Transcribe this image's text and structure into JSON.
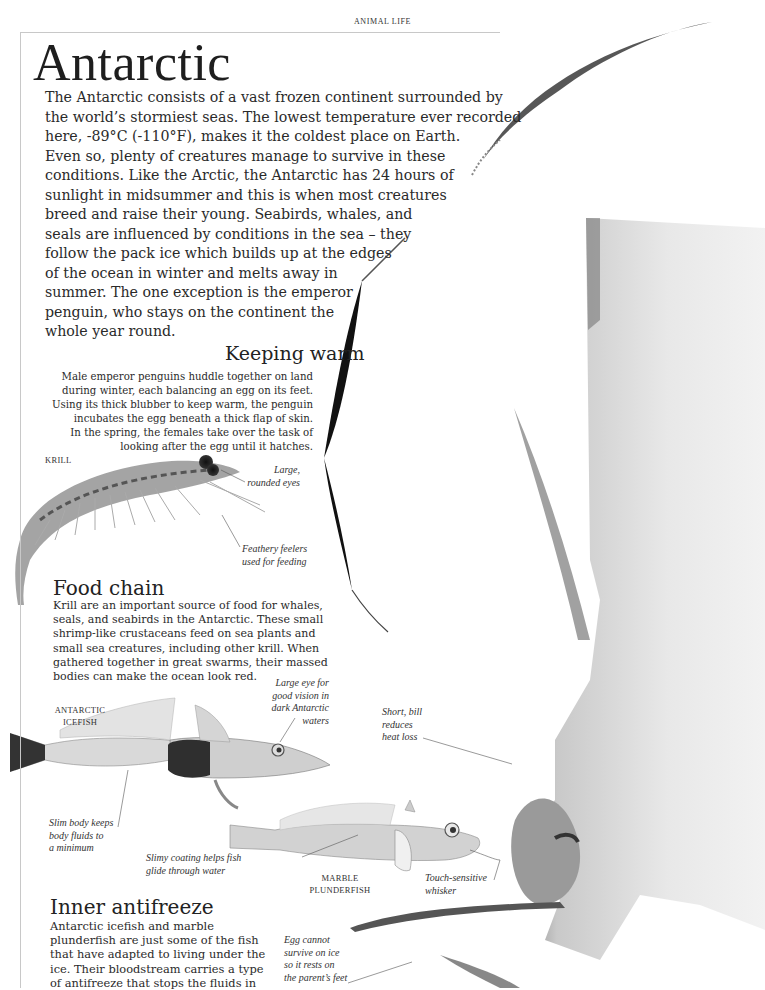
{
  "header": {
    "section_label": "ANIMAL LIFE",
    "title": "Antarctic"
  },
  "intro": {
    "lines": [
      "The Antarctic consists of a vast frozen continent surrounded by",
      "the world’s stormiest seas. The lowest temperature ever recorded",
      "here, -89°C (-110°F), makes it the coldest place on Earth.",
      "Even so, plenty of creatures manage to survive in these",
      "conditions. Like the Arctic, the Antarctic has 24 hours of",
      "sunlight in midsummer and this is when most creatures",
      "breed and raise their young. Seabirds, whales, and",
      "seals are influenced by conditions in the sea – they",
      "follow the pack ice which builds up at the edges",
      "of the ocean in winter and melts away in",
      "summer. The one exception is the emperor",
      "penguin, who stays on the continent the",
      "whole year round."
    ]
  },
  "keeping_warm": {
    "heading": "Keeping warm",
    "lines": [
      "Male emperor penguins huddle together on land",
      "during winter, each balancing an egg on its feet.",
      "Using its thick blubber to keep warm, the penguin",
      "incubates the egg beneath a thick flap of skin.",
      "In the spring, the females take over the task of",
      "looking after the egg until it hatches."
    ]
  },
  "krill": {
    "label": "KRILL",
    "annotations": {
      "eyes": [
        "Large,",
        "rounded eyes"
      ],
      "feelers": [
        "Feathery feelers",
        "used for feeding"
      ]
    }
  },
  "food_chain": {
    "heading": "Food chain",
    "lines": [
      "Krill are an important source of food for whales,",
      "seals, and seabirds in the Antarctic. These small",
      "shrimp-like crustaceans feed on sea plants and",
      "small sea creatures, including other krill. When",
      "gathered together in great swarms, their massed",
      "bodies can make the ocean look red."
    ]
  },
  "icefish": {
    "label": [
      "ANTARCTIC",
      "ICEFISH"
    ],
    "annotations": {
      "eye": [
        "Large eye for",
        "good vision in",
        "dark Antarctic",
        "waters"
      ],
      "body": [
        "Slim body keeps",
        "body fluids to",
        "a minimum"
      ]
    }
  },
  "plunderfish": {
    "label": [
      "MARBLE",
      "PLUNDERFISH"
    ],
    "annotations": {
      "coating": [
        "Slimy coating helps fish",
        "glide through water"
      ],
      "whisker": [
        "Touch-sensitive",
        "whisker"
      ]
    }
  },
  "penguin": {
    "annotations": {
      "bill": [
        "Short, bill",
        "reduces",
        "heat loss"
      ],
      "egg": [
        "Egg cannot",
        "survive on ice",
        "so it rests on",
        "the parent’s feet"
      ]
    }
  },
  "inner_antifreeze": {
    "heading": "Inner antifreeze",
    "lines": [
      "Antarctic icefish and marble",
      "plunderfish are just some of the fish",
      "that have adapted to living under the",
      "ice. Their bloodstream carries a type",
      "of antifreeze that stops the fluids in"
    ]
  }
}
